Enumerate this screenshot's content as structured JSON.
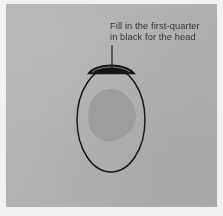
{
  "illustration": {
    "title": "Fill in the first-quarter in black for the head",
    "medium": "printed instructional drawing diagram on grey plate",
    "caption": {
      "line1": "Fill in the first-quarter",
      "line2": "in black for the head"
    },
    "leader_line": {
      "name": "leader-line",
      "from_x": 112,
      "from_y": 45,
      "to_x": 112,
      "to_y": 70
    },
    "shapes": {
      "egg_outline": {
        "name": "egg-outline",
        "center_x": 111,
        "center_y": 120,
        "radius_x": 34,
        "radius_y": 52
      },
      "black_cap": {
        "name": "black-cap-first-quarter",
        "label": "first quarter filled in black for the head",
        "left": 87,
        "top": 65,
        "width": 49,
        "height": 9
      },
      "inner_blob": {
        "name": "inner-shaded-blob",
        "left": 88,
        "top": 89,
        "width": 48,
        "height": 52
      }
    },
    "colors": {
      "plate_background": "#b3b4b2",
      "paper_margin": "#f2f2f0",
      "ink_black": "#151515",
      "blob_grey": "#9b9c99",
      "caption_ink": "#2a2a2a"
    }
  }
}
